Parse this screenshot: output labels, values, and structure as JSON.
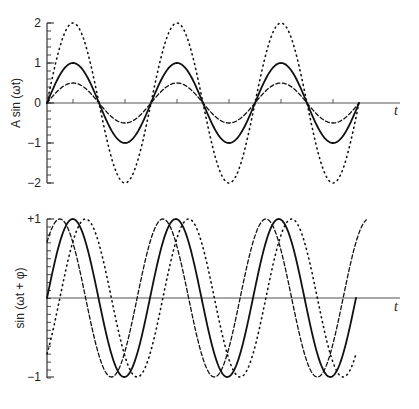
{
  "chart_data": [
    {
      "type": "line",
      "title": "",
      "xlabel": "t",
      "ylabel": "A sin (ωt)",
      "ylim": [
        -2,
        2
      ],
      "yticks": [
        "2",
        "1",
        "0",
        "−1",
        "−2"
      ],
      "ytick_values": [
        2,
        1,
        0,
        -1,
        -2
      ],
      "x_range_periods": [
        0,
        3
      ],
      "series": [
        {
          "name": "A = 1",
          "style": "solid",
          "amplitude": 1,
          "phase": 0
        },
        {
          "name": "A = 0.5",
          "style": "dashed",
          "amplitude": 0.5,
          "phase": 0
        },
        {
          "name": "A = 2",
          "style": "dotted",
          "amplitude": 2,
          "phase": 0
        }
      ]
    },
    {
      "type": "line",
      "title": "",
      "xlabel": "t",
      "ylabel": "sin (ωt + φ)",
      "ylim": [
        -1,
        1
      ],
      "yticks": [
        "+1",
        "−1"
      ],
      "ytick_values": [
        1,
        -1
      ],
      "x_range_periods": [
        0,
        3
      ],
      "series": [
        {
          "name": "φ = 0",
          "style": "solid",
          "amplitude": 1,
          "phase": 0
        },
        {
          "name": "φ = +π/4",
          "style": "dashed",
          "amplitude": 1,
          "phase": 0.785
        },
        {
          "name": "φ = −π/4",
          "style": "dotted",
          "amplitude": 1,
          "phase": -0.785
        }
      ]
    }
  ]
}
